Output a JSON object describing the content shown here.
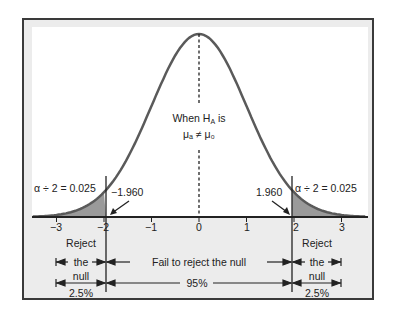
{
  "diagram": {
    "type": "two-tailed hypothesis test normal distribution",
    "hypothesis_label_line1": "When H",
    "hypothesis_label_sub": "A",
    "hypothesis_label_line1_end": " is",
    "hypothesis_label_line2": "μₐ ≠ μ₀",
    "left_alpha_label": "α ÷ 2 = 0.025",
    "right_alpha_label": "α ÷ 2 = 0.025",
    "left_critical_value": "−1.960",
    "right_critical_value": "1.960",
    "x_ticks": [
      "−3",
      "−2",
      "−1",
      "0",
      "1",
      "2",
      "3"
    ],
    "regions": {
      "left_reject": {
        "line1": "Reject",
        "line2": "the",
        "line3": "null",
        "percent": "2.5%"
      },
      "middle": {
        "label": "Fail to reject the null",
        "percent": "95%"
      },
      "right_reject": {
        "line1": "Reject",
        "line2": "the",
        "line3": "null",
        "percent": "2.5%"
      }
    },
    "colors": {
      "curve": "#5a5a5a",
      "shade": "#9a9a9a",
      "axis": "#222222",
      "panel_bg": "#ececec",
      "plot_bg": "#ffffff",
      "frame": "#3a3a3a"
    }
  },
  "chart_data": {
    "type": "area",
    "title": "",
    "xlabel": "z",
    "ylabel": "",
    "xlim": [
      -3.5,
      3.5
    ],
    "x_ticks": [
      -3,
      -2,
      -1,
      0,
      1,
      2,
      3
    ],
    "critical_values": [
      -1.96,
      1.96
    ],
    "shaded_regions": [
      {
        "from": -3.5,
        "to": -1.96,
        "area": 0.025,
        "label": "α ÷ 2 = 0.025"
      },
      {
        "from": 1.96,
        "to": 3.5,
        "area": 0.025,
        "label": "α ÷ 2 = 0.025"
      }
    ],
    "annotations": [
      "When H_A is μ_A ≠ μ_0",
      "−1.960",
      "1.960",
      "Reject the null",
      "Fail to reject the null",
      "2.5%",
      "95%",
      "2.5%"
    ]
  }
}
